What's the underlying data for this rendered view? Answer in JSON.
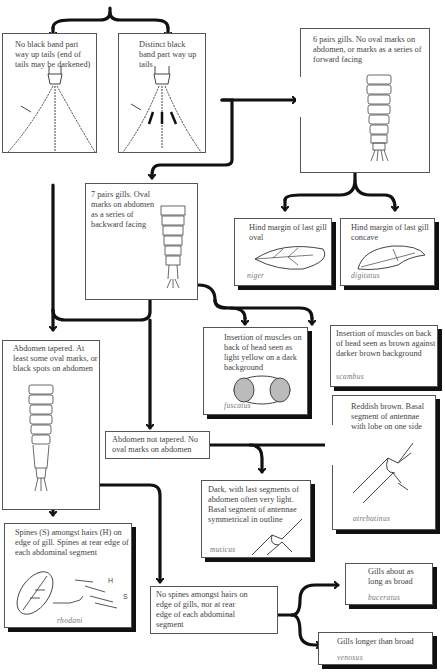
{
  "boxes": {
    "no_black_band": {
      "text": "No black band part way up tails (end of tails may be darkened)"
    },
    "distinct_black_band": {
      "text": "Distinct black band part way up tails"
    },
    "six_pairs": {
      "text": "6 pairs gills. No oval marks on abdomen, or marks as a series of forward facing"
    },
    "seven_pairs": {
      "text": "7 pairs gills. Oval marks on abdomen as a series of backward facing"
    },
    "hind_oval": {
      "text": "Hind margin of last gill oval",
      "species": "niger"
    },
    "hind_concave": {
      "text": "Hind margin of last gill concave",
      "species": "digitatus"
    },
    "light_yellow": {
      "text": "Insertion of muscles on back of head seen as light yellow on a dark background",
      "species": "fuscatus"
    },
    "brown_against": {
      "text": "Insertion of muscles on back of head seen as brown against darker brown background",
      "species": "scambus"
    },
    "abdomen_tapered": {
      "text": "Abdomen tapered. At least some oval marks, or black spots on abdomen"
    },
    "reddish_brown": {
      "text": "Reddish brown. Basal segment of antennae with lobe on one side",
      "species": "atrebatinus"
    },
    "abdomen_not_tapered": {
      "text": "Abdomen not tapered. No oval marks on abdomen"
    },
    "dark_last_segments": {
      "text": "Dark, with last segments of abdomen often very light. Basal segment of antennae symmetrical in outline",
      "species": "muticus"
    },
    "spines_amongst": {
      "text": "Spines (S) amongst hairs (H) on edge of gill. Spines at rear edge of each abdominal segment",
      "species": "rhodani",
      "label_h": "H",
      "label_s": "S"
    },
    "no_spines": {
      "text": "No spines amongst hairs on edge of gills, nor at rear edge of each abdominal segment"
    },
    "gills_broad": {
      "text": "Gills about as long as broad",
      "species": "buceratus"
    },
    "gills_longer": {
      "text": "Gills longer than broad",
      "species": "venosus"
    }
  },
  "colors": {
    "line": "#111111",
    "border": "#555555",
    "text": "#444444",
    "species": "#777777"
  }
}
